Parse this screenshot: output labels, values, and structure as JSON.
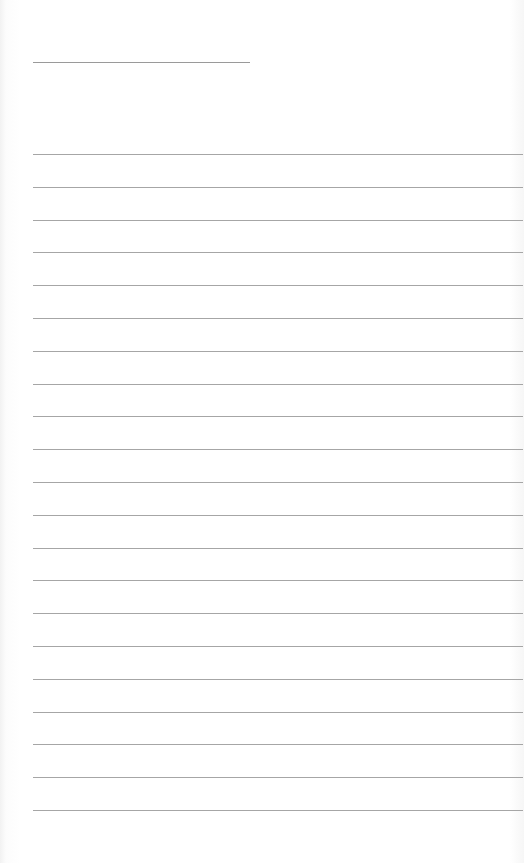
{
  "document": {
    "type": "lined-paper",
    "header_line": {
      "label": ""
    },
    "rules": [
      {
        "text": ""
      },
      {
        "text": ""
      },
      {
        "text": ""
      },
      {
        "text": ""
      },
      {
        "text": ""
      },
      {
        "text": ""
      },
      {
        "text": ""
      },
      {
        "text": ""
      },
      {
        "text": ""
      },
      {
        "text": ""
      },
      {
        "text": ""
      },
      {
        "text": ""
      },
      {
        "text": ""
      },
      {
        "text": ""
      },
      {
        "text": ""
      },
      {
        "text": ""
      },
      {
        "text": ""
      },
      {
        "text": ""
      },
      {
        "text": ""
      },
      {
        "text": ""
      },
      {
        "text": ""
      }
    ],
    "colors": {
      "line": "#a6a6a6",
      "paper": "#ffffff"
    }
  }
}
